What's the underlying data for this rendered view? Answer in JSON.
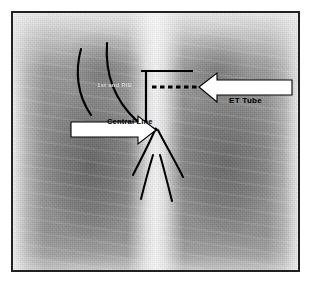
{
  "figure": {
    "kind": "annotated-chest-radiograph",
    "modality_label": "Chest X-Ray",
    "frame_border_color": "#23211f",
    "background_color": "#ffffff",
    "film_base_color": "#8d8d8d"
  },
  "annotations": {
    "et_tube": {
      "label": "ET Tube",
      "callout_shape": "left-pointing-arrow",
      "callout_fill": "#ffffff",
      "callout_stroke": "#000000",
      "marker": "t-bar-with-dashed-line",
      "marker_color": "#000000"
    },
    "central_line": {
      "label": "Central Line",
      "callout_shape": "right-pointing-arrow",
      "callout_fill": "#ffffff",
      "callout_stroke": "#000000",
      "marker": "curved-catheter-line",
      "marker_color": "#000000"
    },
    "rib": {
      "label": "1st and RIB",
      "callout_shape": "plain-text",
      "marker": "two-curved-rib-outlines",
      "marker_color": "#000000"
    },
    "airway": {
      "label": "trachea-and-main-bronchi",
      "marker": "bronchial-tree-outline",
      "marker_color": "#000000"
    }
  }
}
